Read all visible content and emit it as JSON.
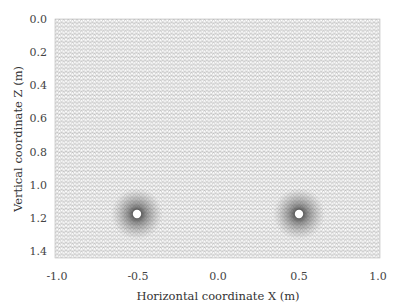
{
  "figure": {
    "xlabel": "Horizontal coordinate  X (m)",
    "ylabel": "Vertical coordinate Z (m)",
    "x_ticks": [
      "-1.0",
      "-0.5",
      "0.0",
      "0.5",
      "1.0"
    ],
    "y_ticks": [
      "0.0",
      "0.2",
      "0.4",
      "0.6",
      "0.8",
      "1.0",
      "1.2",
      "1.4"
    ],
    "xlim": [
      -1.0,
      1.0
    ],
    "ylim": [
      0.0,
      1.45
    ],
    "holes": [
      {
        "x": -0.5,
        "z": 1.17
      },
      {
        "x": 0.5,
        "z": 1.17
      }
    ],
    "colors": {
      "mesh": "#8a8a8a",
      "background": "#ffffff",
      "text": "#444444"
    }
  }
}
